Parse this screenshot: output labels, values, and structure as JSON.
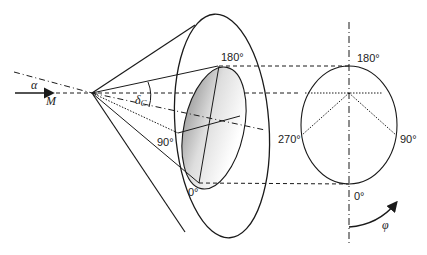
{
  "diagram": {
    "type": "cone-projection",
    "left_labels": {
      "alpha": "α",
      "M": "M",
      "delta_c": "δ",
      "delta_c_sub": "C"
    },
    "cone_labels": {
      "top": "180°",
      "left": "90°",
      "bottom": "0°"
    },
    "circle_labels": {
      "top": "180°",
      "left": "270°",
      "right": "90°",
      "bottom": "0°"
    },
    "rotation_label": "φ",
    "colors": {
      "line": "#1a1a1a",
      "shade_dark": "#9a9a9a",
      "shade_light": "#ffffff"
    }
  }
}
